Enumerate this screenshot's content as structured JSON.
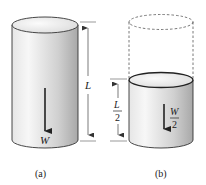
{
  "figure": {
    "panel_a": {
      "caption": "(a)",
      "length_label": "L",
      "weight_label": "W"
    },
    "panel_b": {
      "caption": "(b)",
      "length_label_num": "L",
      "length_label_den": "2",
      "weight_label_num": "W",
      "weight_label_den": "2"
    }
  },
  "colors": {
    "stroke": "#333333",
    "shade_light": "#f4f4f4",
    "shade_dark": "#b8b8b8",
    "top_face": "#f2f2f2"
  }
}
